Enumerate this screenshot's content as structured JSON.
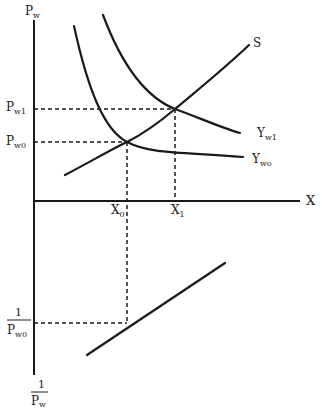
{
  "diagram": {
    "axes": {
      "vertical_top_label": {
        "main": "P",
        "sub": "w"
      },
      "horizontal_label": "X",
      "vertical_bottom_label": {
        "numerator": "1",
        "denominator_main": "P",
        "denominator_sub": "w"
      }
    },
    "price_levels": [
      {
        "main": "P",
        "sub": "w1"
      },
      {
        "main": "P",
        "sub": "w0"
      }
    ],
    "quantity_levels": [
      {
        "main": "X",
        "sub": "0"
      },
      {
        "main": "X",
        "sub": "1"
      }
    ],
    "inverse_price_label": {
      "numerator": "1",
      "denominator_main": "P",
      "denominator_sub": "w0"
    },
    "curves": {
      "supply": "S",
      "demand_high": {
        "main": "Y",
        "sub": "w1"
      },
      "demand_low": {
        "main": "Y",
        "sub": "wo"
      }
    },
    "colors": {
      "ink": "#1a1a1a",
      "background": "#ffffff"
    }
  }
}
